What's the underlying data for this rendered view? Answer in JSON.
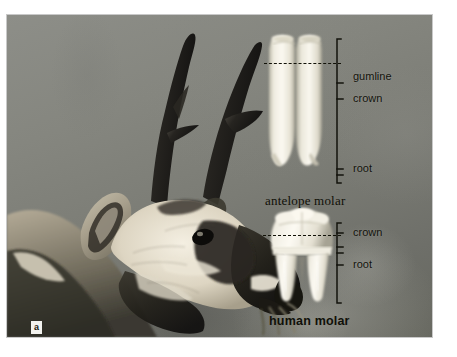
{
  "figure": {
    "panel_letter": "a"
  },
  "antelope_molar": {
    "name_label": "antelope molar",
    "callouts": [
      {
        "key": "gumline",
        "label": "gumline"
      },
      {
        "key": "crown",
        "label": "crown"
      },
      {
        "key": "root",
        "label": "root"
      }
    ]
  },
  "human_molar": {
    "name_label": "human molar",
    "callouts": [
      {
        "key": "crown",
        "label": "crown"
      },
      {
        "key": "root",
        "label": "root"
      }
    ]
  },
  "colors": {
    "photo_background_light": "#8d8e88",
    "photo_background_dark": "#66675f",
    "tooth_enamel": "#eceade",
    "annotation_ink": "#13130c",
    "page_background": "#ffffff",
    "animal_dark": "#1a1a16",
    "animal_light": "#d9d4c4"
  }
}
